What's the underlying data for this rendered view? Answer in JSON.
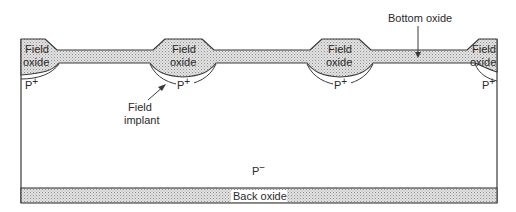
{
  "figure": {
    "type": "MOS cross-section diagram",
    "labels": {
      "field_oxide_1_line1": "Field",
      "field_oxide_1_line2": "oxide",
      "field_oxide_2_line1": "Field",
      "field_oxide_2_line2": "oxide",
      "field_oxide_3_line1": "Field",
      "field_oxide_3_line2": "oxide",
      "field_oxide_4_line1": "Field",
      "field_oxide_4_line2": "oxide",
      "p_plus_1": "P",
      "p_plus_2": "P",
      "p_plus_3": "P",
      "p_plus_4": "P",
      "p_plus_sup": "+",
      "field_implant_line1": "Field",
      "field_implant_line2": "implant",
      "bottom_oxide": "Bottom oxide",
      "substrate": "P",
      "substrate_sup": "−",
      "back_oxide": "Back oxide"
    },
    "colors": {
      "outline": "#3a3a3a",
      "oxide_fill": "#d9d9d9",
      "oxide_dot": "#9a9a9a",
      "substrate_fill": "#ffffff",
      "text": "#2a2a2a"
    }
  }
}
